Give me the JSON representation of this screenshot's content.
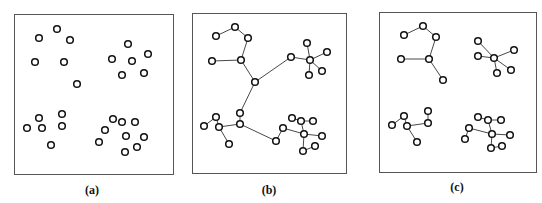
{
  "figure": {
    "panels": [
      {
        "label": "(a)",
        "description": "Unconnected points in four clusters",
        "nodes": [
          [
            39,
            38
          ],
          [
            57,
            29
          ],
          [
            70,
            40
          ],
          [
            35,
            62
          ],
          [
            64,
            62
          ],
          [
            77,
            84
          ],
          [
            128,
            44
          ],
          [
            148,
            54
          ],
          [
            112,
            59
          ],
          [
            132,
            61
          ],
          [
            144,
            73
          ],
          [
            122,
            75
          ],
          [
            39,
            118
          ],
          [
            62,
            114
          ],
          [
            27,
            128
          ],
          [
            42,
            128
          ],
          [
            62,
            126
          ],
          [
            51,
            145
          ],
          [
            113,
            119
          ],
          [
            122,
            122
          ],
          [
            135,
            122
          ],
          [
            105,
            130
          ],
          [
            126,
            136
          ],
          [
            144,
            137
          ],
          [
            99,
            142
          ],
          [
            137,
            147
          ],
          [
            125,
            152
          ]
        ],
        "edges": []
      },
      {
        "label": "(b)",
        "description": "Minimum spanning tree connecting all points",
        "nodes": [
          [
            216,
            36
          ],
          [
            235,
            27
          ],
          [
            248,
            38
          ],
          [
            212,
            61
          ],
          [
            241,
            60
          ],
          [
            255,
            82
          ],
          [
            291,
            57
          ],
          [
            310,
            60
          ],
          [
            307,
            43
          ],
          [
            327,
            52
          ],
          [
            322,
            71
          ],
          [
            309,
            75
          ],
          [
            240,
            113
          ],
          [
            240,
            124
          ],
          [
            216,
            117
          ],
          [
            204,
            126
          ],
          [
            219,
            127
          ],
          [
            229,
            144
          ],
          [
            276,
            141
          ],
          [
            283,
            128
          ],
          [
            292,
            118
          ],
          [
            301,
            121
          ],
          [
            313,
            121
          ],
          [
            304,
            134
          ],
          [
            322,
            136
          ],
          [
            315,
            146
          ],
          [
            303,
            151
          ]
        ],
        "edges": [
          [
            0,
            1
          ],
          [
            1,
            2
          ],
          [
            2,
            4
          ],
          [
            3,
            4
          ],
          [
            4,
            5
          ],
          [
            5,
            6
          ],
          [
            6,
            7
          ],
          [
            7,
            8
          ],
          [
            7,
            9
          ],
          [
            7,
            10
          ],
          [
            7,
            11
          ],
          [
            5,
            12
          ],
          [
            12,
            13
          ],
          [
            15,
            14
          ],
          [
            14,
            16
          ],
          [
            16,
            13
          ],
          [
            16,
            17
          ],
          [
            13,
            18
          ],
          [
            18,
            19
          ],
          [
            19,
            23
          ],
          [
            20,
            21
          ],
          [
            21,
            22
          ],
          [
            21,
            23
          ],
          [
            23,
            24
          ],
          [
            23,
            26
          ],
          [
            26,
            25
          ]
        ]
      },
      {
        "label": "(c)",
        "description": "Tree after removing inconsistent edges, yielding four clusters",
        "nodes": [
          [
            404,
            35
          ],
          [
            423,
            26
          ],
          [
            436,
            37
          ],
          [
            401,
            59
          ],
          [
            429,
            59
          ],
          [
            443,
            80
          ],
          [
            478,
            41
          ],
          [
            478,
            56
          ],
          [
            494,
            58
          ],
          [
            514,
            50
          ],
          [
            511,
            70
          ],
          [
            497,
            73
          ],
          [
            428,
            111
          ],
          [
            428,
            123
          ],
          [
            404,
            116
          ],
          [
            392,
            125
          ],
          [
            407,
            126
          ],
          [
            417,
            142
          ],
          [
            465,
            139
          ],
          [
            469,
            128
          ],
          [
            478,
            117
          ],
          [
            488,
            120
          ],
          [
            501,
            120
          ],
          [
            492,
            134
          ],
          [
            510,
            135
          ],
          [
            491,
            148
          ],
          [
            502,
            146
          ]
        ],
        "edges": [
          [
            0,
            1
          ],
          [
            1,
            2
          ],
          [
            2,
            4
          ],
          [
            3,
            4
          ],
          [
            4,
            5
          ],
          [
            7,
            8
          ],
          [
            8,
            6
          ],
          [
            8,
            9
          ],
          [
            8,
            10
          ],
          [
            8,
            11
          ],
          [
            12,
            13
          ],
          [
            15,
            14
          ],
          [
            14,
            16
          ],
          [
            16,
            13
          ],
          [
            16,
            17
          ],
          [
            18,
            19
          ],
          [
            19,
            23
          ],
          [
            20,
            21
          ],
          [
            21,
            22
          ],
          [
            21,
            23
          ],
          [
            23,
            24
          ],
          [
            23,
            25
          ],
          [
            25,
            26
          ]
        ]
      }
    ]
  }
}
